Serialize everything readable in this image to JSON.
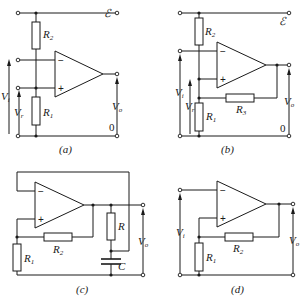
{
  "figure": {
    "panels": [
      {
        "id": "a",
        "caption": "(a)",
        "labels": {
          "supply": "ℰ",
          "r2": "R",
          "r2_sub": "2",
          "r1": "R",
          "r1_sub": "1",
          "vi": "V",
          "vi_sub": "i",
          "vr": "V",
          "vr_sub": "r",
          "vo": "V",
          "vo_sub": "o",
          "zero": "0",
          "minus": "−",
          "plus": "+"
        }
      },
      {
        "id": "b",
        "caption": "(b)",
        "labels": {
          "supply": "ℰ",
          "r2": "R",
          "r2_sub": "2",
          "r1": "R",
          "r1_sub": "1",
          "r3": "R",
          "r3_sub": "3",
          "vi": "V",
          "vi_sub": "i",
          "vr": "V",
          "vr_sub": "r",
          "vo": "V",
          "vo_sub": "o",
          "zero": "0",
          "minus": "−",
          "plus": "+"
        }
      },
      {
        "id": "c",
        "caption": "(c)",
        "labels": {
          "r": "R",
          "c": "C",
          "r2": "R",
          "r2_sub": "2",
          "r1": "R",
          "r1_sub": "1",
          "vo": "V",
          "vo_sub": "o",
          "minus": "−",
          "plus": "+"
        }
      },
      {
        "id": "d",
        "caption": "(d)",
        "labels": {
          "r2": "R",
          "r2_sub": "2",
          "r1": "R",
          "r1_sub": "1",
          "vi": "V",
          "vi_sub": "i",
          "vo": "V",
          "vo_sub": "o",
          "minus": "−",
          "plus": "+"
        }
      }
    ]
  }
}
